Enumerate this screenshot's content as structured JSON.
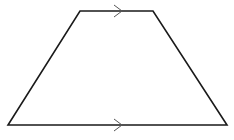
{
  "diagram": {
    "type": "trapezium",
    "stroke_color": "#1a1a1a",
    "arrow_color": "#555555",
    "vertices": {
      "top_left": [
        80,
        11
      ],
      "top_right": [
        153,
        11
      ],
      "bottom_right": [
        227,
        125
      ],
      "bottom_left": [
        8,
        125
      ]
    },
    "parallel_markers": [
      {
        "side": "top",
        "x": 118,
        "y": 11
      },
      {
        "side": "bottom",
        "x": 118,
        "y": 125
      }
    ]
  }
}
